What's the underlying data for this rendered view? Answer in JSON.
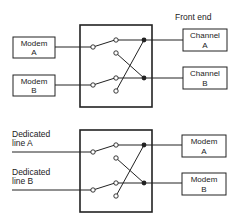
{
  "diagram": {
    "title": "",
    "top_section": {
      "header_label": "Front end",
      "inputs": [
        {
          "line1": "Modem",
          "line2": "A"
        },
        {
          "line1": "Modem",
          "line2": "B"
        }
      ],
      "outputs": [
        {
          "line1": "Channel",
          "line2": "A"
        },
        {
          "line1": "Channel",
          "line2": "B"
        }
      ]
    },
    "bottom_section": {
      "inputs": [
        {
          "line1": "Dedicated",
          "line2": "line A"
        },
        {
          "line1": "Dedicated",
          "line2": "line B"
        }
      ],
      "outputs": [
        {
          "line1": "Modem",
          "line2": "A"
        },
        {
          "line1": "Modem",
          "line2": "B"
        }
      ]
    },
    "colors": {
      "stroke": "#222222",
      "background": "#ffffff"
    }
  }
}
